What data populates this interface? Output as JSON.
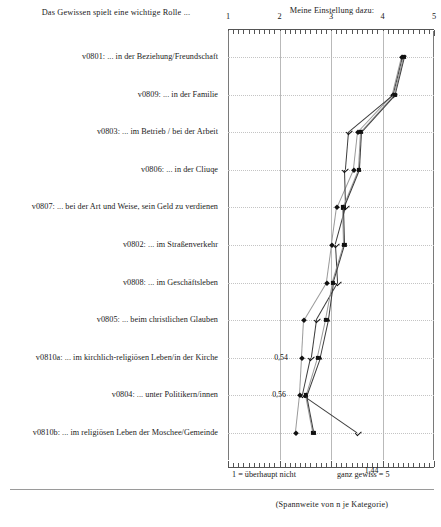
{
  "header": {
    "left_title": "Das Gewissen spielt eine wichtige Rolle ...",
    "axis_title": "Meine Einstellung dazu:"
  },
  "axis": {
    "ticks": [
      "1",
      "2",
      "3",
      "4",
      "5"
    ],
    "anchor_low": "1 = überhaupt nicht",
    "anchor_high": "ganz gewiss = 5"
  },
  "footnote": "(Spannweite von n je Kategorie)",
  "annotations": [
    {
      "text": "0,54",
      "category_index": 8,
      "x_value": 2.48
    },
    {
      "text": "0,56",
      "category_index": 9,
      "x_value": 2.44
    },
    {
      "text": "1,44",
      "category_index": 11,
      "x_value": 3.52
    }
  ],
  "chart_data": {
    "type": "line",
    "title": "Das Gewissen spielt eine wichtige Rolle ...",
    "xlabel": "Meine Einstellung dazu:",
    "ylabel": "",
    "xlim": [
      1,
      5
    ],
    "grid": true,
    "legend": "none",
    "orientation": "horizontal",
    "categories": [
      "v0801: ... in der Beziehung/Freundschaft",
      "v0809: ... in der Familie",
      "v0803: ... im Betrieb / bei der Arbeit",
      "v0806: ... in der Cliuqe",
      "v0807: ... bei der Art und Weise, sein Geld zu verdienen",
      "v0802: ... im Straßenverkehr",
      "v0808: ... im Geschäftsleben",
      "v0805: ... beim christlichen Glauben",
      "v0810a: ... im kirchlich-religiösen Leben/in der Kirche",
      "v0804: ... unter Politikern/innen",
      "v0810b: ... im religiösen Leben der Moschee/Gemeinde"
    ],
    "category_labels": [
      "v0801: ... in der Beziehung/Freundschaft",
      "v0809: ... in der Familie",
      "v0803: ... im Betrieb / bei der Arbeit",
      "v0806: ... in der Cliuqe",
      "v0807: ... bei der Art und Weise, sein Geld zu verdienen",
      "v0802: ... im Straßenverkehr",
      "v0808: ... im Geschäftsleben",
      "v0805: ... beim christlichen Glauben",
      "v0810a: ... im kirchlich-religiösen Leben/in der Kirche",
      "v0804: ... unter Politikern/innen",
      "v0810b: ... im religiösen Leben der Moschee/Gemeinde"
    ],
    "series": [
      {
        "name": "diamond",
        "marker": "diamond",
        "values": [
          4.38,
          4.2,
          3.52,
          3.44,
          3.12,
          3.02,
          2.92,
          2.48,
          2.44,
          2.4,
          2.32
        ]
      },
      {
        "name": "check",
        "marker": "check",
        "values": [
          4.4,
          4.22,
          3.34,
          3.28,
          3.3,
          3.1,
          3.14,
          2.72,
          2.62,
          2.46,
          3.52
        ]
      },
      {
        "name": "square",
        "marker": "square",
        "values": [
          4.42,
          4.24,
          3.58,
          3.54,
          3.24,
          3.26,
          3.04,
          2.9,
          2.74,
          2.52,
          2.66
        ]
      },
      {
        "name": "triangle",
        "marker": "triangle",
        "values": [
          4.44,
          4.26,
          3.6,
          3.56,
          3.26,
          3.28,
          3.06,
          2.96,
          2.8,
          2.54,
          2.68
        ]
      }
    ]
  }
}
